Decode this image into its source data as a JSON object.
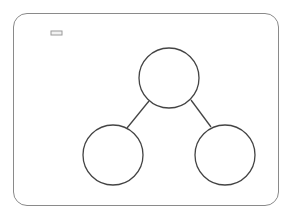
{
  "diagram": {
    "type": "number-bond",
    "frame": {
      "border_color": "#8a8a8a"
    },
    "cube_stack": {
      "total": 8,
      "cubes": [
        {
          "color": "light",
          "fill": "#f2f2f2"
        },
        {
          "color": "light",
          "fill": "#f2f2f2"
        },
        {
          "color": "light",
          "fill": "#f2f2f2"
        },
        {
          "color": "light",
          "fill": "#f2f2f2"
        },
        {
          "color": "dark",
          "fill": "#3a3a3a"
        },
        {
          "color": "dark",
          "fill": "#3a3a3a"
        },
        {
          "color": "dark",
          "fill": "#3a3a3a"
        },
        {
          "color": "dark",
          "fill": "#3a3a3a"
        }
      ],
      "light_count": 4,
      "dark_count": 4
    },
    "bond": {
      "whole": {
        "label": ""
      },
      "parts": [
        {
          "label": ""
        },
        {
          "label": ""
        }
      ],
      "stroke_color": "#444444"
    }
  }
}
